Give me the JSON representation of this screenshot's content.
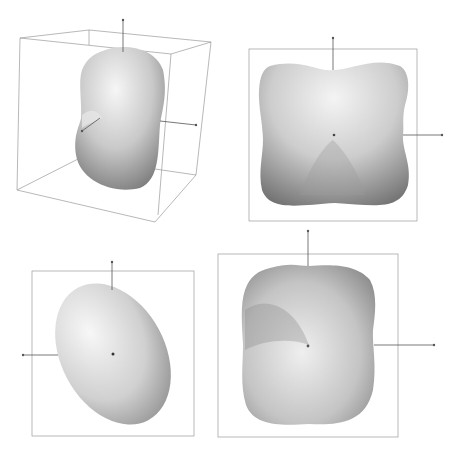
{
  "figure": {
    "panels": [
      {
        "id": "perspective-view",
        "view": "3D perspective with bounding box",
        "shape": "peanut-shaped surface"
      },
      {
        "id": "front-view",
        "view": "orthographic front view",
        "shape": "four-lobed square surface"
      },
      {
        "id": "side-view",
        "view": "orthographic side view",
        "shape": "tilted ellipsoid"
      },
      {
        "id": "top-view",
        "view": "orthographic top view",
        "shape": "rounded square surface with dimple"
      }
    ],
    "colors": {
      "frame": "#8a8a8a",
      "axis": "#555555",
      "surface_light": "#f2f2f2",
      "surface_mid": "#bdbdbd",
      "surface_dark": "#7a7a7a"
    }
  }
}
